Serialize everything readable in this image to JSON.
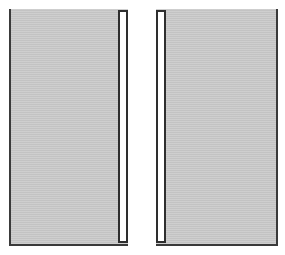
{
  "panes": [
    {
      "id": "left",
      "scrollbar_side": "right",
      "fill_color": "#c9c9c9",
      "border_color": "#3a3a3a"
    },
    {
      "id": "right",
      "scrollbar_side": "left",
      "fill_color": "#c9c9c9",
      "border_color": "#3a3a3a"
    }
  ],
  "colors": {
    "background": "#ffffff",
    "pane_fill": "#c9c9c9",
    "border": "#3a3a3a",
    "scrollbar_track": "#ffffff"
  }
}
